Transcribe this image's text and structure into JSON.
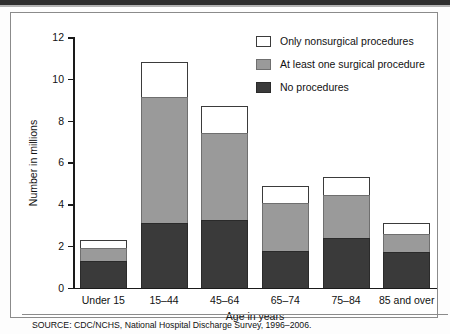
{
  "figure": {
    "source_note": "SOURCE: CDC/NCHS, National Hospital Discharge Survey, 1996–2006."
  },
  "chart_data": {
    "type": "bar",
    "subtype": "stacked-vertical",
    "title": "",
    "xlabel": "Age in years",
    "ylabel": "Number in millions",
    "ylim": [
      0,
      12
    ],
    "yticks": [
      0,
      2,
      4,
      6,
      8,
      10,
      12
    ],
    "ytick_labels": [
      "0",
      "2",
      "4",
      "6",
      "8",
      "10",
      "12"
    ],
    "grid": false,
    "legend_position": "top-right",
    "categories": [
      "Under 15",
      "15–44",
      "45–64",
      "65–74",
      "75–84",
      "85 and over"
    ],
    "series": [
      {
        "name": "No procedures",
        "color": "#3a3a3a",
        "values": [
          1.25,
          3.1,
          3.25,
          1.75,
          2.35,
          1.7
        ]
      },
      {
        "name": "At least one surgical procedure",
        "color": "#9a9a9a",
        "values": [
          0.65,
          6.05,
          4.15,
          2.3,
          2.1,
          0.85
        ]
      },
      {
        "name": "Only nonsurgical procedures",
        "color": "#ffffff",
        "values": [
          0.4,
          1.65,
          1.3,
          0.8,
          0.85,
          0.55
        ]
      }
    ],
    "totals": [
      2.3,
      10.8,
      8.7,
      4.85,
      5.3,
      3.1
    ],
    "legend_order_top_to_bottom": [
      "Only nonsurgical procedures",
      "At least one surgical procedure",
      "No procedures"
    ]
  }
}
